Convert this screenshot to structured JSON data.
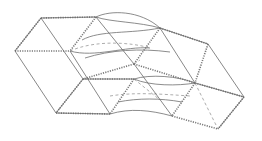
{
  "figure": {
    "title": "Patent-style line drawing of tessellated rhombic cells with curved flow channels",
    "caption": "",
    "colors": {
      "background": "#ffffff",
      "line": "#6a6a6a",
      "hatch": "#7a7a7a",
      "dashed": "#8a8a8a"
    },
    "elements": {
      "cells": [
        {
          "name": "upper-left-cell",
          "faces": [
            "top",
            "front"
          ]
        },
        {
          "name": "lower-left-cell",
          "faces": [
            "top",
            "front"
          ]
        },
        {
          "name": "upper-right-cell",
          "faces": [
            "top",
            "front"
          ]
        },
        {
          "name": "lower-right-cell",
          "faces": [
            "top",
            "front"
          ]
        }
      ],
      "channels": [
        {
          "name": "upper-channel",
          "type": "elliptic-tube"
        },
        {
          "name": "lower-channel",
          "type": "elliptic-tube"
        }
      ]
    }
  }
}
